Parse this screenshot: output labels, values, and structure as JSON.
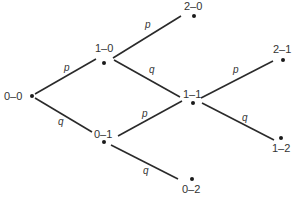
{
  "diagram": {
    "type": "probability-tree",
    "width": 293,
    "height": 198,
    "colors": {
      "line": "#2a2a2a",
      "dot": "#1a1a1a",
      "text": "#333333",
      "background": "#ffffff"
    },
    "nodes": [
      {
        "id": "0-0",
        "label": "0–0",
        "x": 32,
        "y": 96,
        "label_x": 4,
        "label_y": 100,
        "anchor": "start"
      },
      {
        "id": "1-0",
        "label": "1–0",
        "x": 104,
        "y": 63,
        "label_x": 95,
        "label_y": 52,
        "anchor": "start"
      },
      {
        "id": "0-1",
        "label": "0–1",
        "x": 104,
        "y": 142,
        "label_x": 94,
        "label_y": 138,
        "anchor": "start"
      },
      {
        "id": "2-0",
        "label": "2–0",
        "x": 194,
        "y": 16,
        "label_x": 184,
        "label_y": 10,
        "anchor": "start"
      },
      {
        "id": "1-1",
        "label": "1–1",
        "x": 193,
        "y": 103,
        "label_x": 183,
        "label_y": 98,
        "anchor": "start"
      },
      {
        "id": "0-2",
        "label": "0–2",
        "x": 192,
        "y": 179,
        "label_x": 182,
        "label_y": 193,
        "anchor": "start"
      },
      {
        "id": "2-1",
        "label": "2–1",
        "x": 283,
        "y": 60,
        "label_x": 273,
        "label_y": 53,
        "anchor": "start"
      },
      {
        "id": "1-2",
        "label": "1–2",
        "x": 281,
        "y": 138,
        "label_x": 272,
        "label_y": 152,
        "anchor": "start"
      }
    ],
    "edges": [
      {
        "from": "0-0",
        "to": "1-0",
        "label": "p",
        "x1": 35,
        "y1": 94,
        "x2": 96,
        "y2": 59,
        "label_x": 64,
        "label_y": 71
      },
      {
        "from": "0-0",
        "to": "0-1",
        "label": "q",
        "x1": 35,
        "y1": 98,
        "x2": 92,
        "y2": 132,
        "label_x": 58,
        "label_y": 125
      },
      {
        "from": "1-0",
        "to": "2-0",
        "label": "p",
        "x1": 113,
        "y1": 58,
        "x2": 181,
        "y2": 16,
        "label_x": 145,
        "label_y": 28
      },
      {
        "from": "1-0",
        "to": "1-1",
        "label": "q",
        "x1": 114,
        "y1": 60,
        "x2": 180,
        "y2": 97,
        "label_x": 149,
        "label_y": 73
      },
      {
        "from": "0-1",
        "to": "1-1",
        "label": "p",
        "x1": 118,
        "y1": 136,
        "x2": 182,
        "y2": 101,
        "label_x": 142,
        "label_y": 117
      },
      {
        "from": "0-1",
        "to": "0-2",
        "label": "q",
        "x1": 111,
        "y1": 145,
        "x2": 178,
        "y2": 179,
        "label_x": 143,
        "label_y": 174
      },
      {
        "from": "1-1",
        "to": "2-1",
        "label": "p",
        "x1": 201,
        "y1": 98,
        "x2": 273,
        "y2": 61,
        "label_x": 233,
        "label_y": 73
      },
      {
        "from": "1-1",
        "to": "1-2",
        "label": "q",
        "x1": 202,
        "y1": 103,
        "x2": 274,
        "y2": 140,
        "label_x": 242,
        "label_y": 121
      }
    ]
  }
}
